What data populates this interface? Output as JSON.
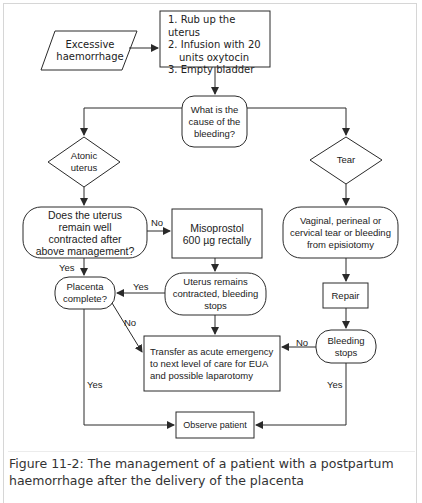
{
  "figure": {
    "caption": "Figure 11-2: The management of a patient with a postpartum haemorrhage after the delivery of the placenta"
  },
  "nodes": {
    "start": "Excessive haemorrhage",
    "initial_steps": [
      "1. Rub up the uterus",
      "2. Infusion with 20",
      "units oxytocin",
      "3. Empty bladder"
    ],
    "cause_question": "What is the cause of the bleeding?",
    "atonic": "Atonic uterus",
    "tear": "Tear",
    "contracted_question": "Does the uterus remain well contracted after above management?",
    "misoprostol": "Misoprostol 600 µg  rectally",
    "tear_types": "Vaginal, perineal or cervical tear or bleeding from episiotomy",
    "placenta_question": "Placenta complete?",
    "uterus_contracted": "Uterus remains contracted, bleeding stops",
    "repair": "Repair",
    "transfer": "Transfer as acute emergency to next level of care for EUA and possible laparotomy",
    "bleeding_stops": "Bleeding stops",
    "observe": "Observe patient"
  },
  "edge_labels": {
    "contracted_no": "No",
    "contracted_yes": "Yes",
    "uterus_yes": "Yes",
    "placenta_no": "No",
    "placenta_yes": "Yes",
    "bleeding_no": "No",
    "bleeding_yes": "Yes"
  },
  "colors": {
    "stroke": "#2a2a2a",
    "text": "#222222",
    "caption": "#333333",
    "border": "#d6d6d6"
  }
}
